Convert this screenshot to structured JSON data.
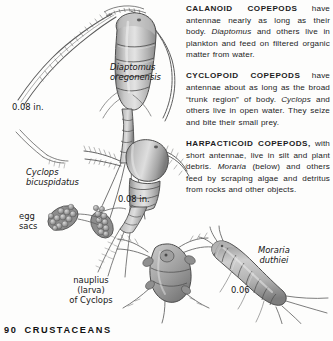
{
  "page": {
    "number": "90",
    "section_title": "CRUSTACEANS"
  },
  "text_column": {
    "paragraphs": [
      {
        "lead": "CALANOID COPEPODS",
        "body_before_italic": " have antennae nearly as long as their body. ",
        "italic": "Diaptomus",
        "body_after_italic": " and others live in plankton and feed on filtered organic matter from water."
      },
      {
        "lead": "CYCLOPOID COPEPODS",
        "body_before_italic": " have antennae about as long as the broad “trunk region” of body. ",
        "italic": "Cyclops",
        "body_after_italic": " and others live in open water. They seize and bite their small prey."
      },
      {
        "lead": "HARPACTICOID COPEPODS,",
        "body_before_italic": " with short antennae, live in silt and plant debris. ",
        "italic": "Moraria",
        "body_after_italic": " (below) and others feed by scraping algae and detritus from rocks and other objects."
      }
    ]
  },
  "illustration": {
    "labels": {
      "diaptomus": "Diaptomus\noregonensis",
      "cyclops": "Cyclops\nbicuspidatus",
      "egg_sacs": "egg\nsacs",
      "nauplius": "nauplius\n(larva)\nof Cyclops",
      "moraria": "Moraria\nduthiei"
    },
    "measurements": {
      "diaptomus_size": "0.08 in.",
      "cyclops_size": "0.08 in.",
      "moraria_size": "0.06"
    }
  },
  "colors": {
    "page_background": "#fdfdfc",
    "ink": "#1c1c1c",
    "art_shade_light": "#cfcfcf",
    "art_shade_mid": "#a8a8a8",
    "art_shade_dark": "#6e6e6e",
    "art_outline": "#3a3a3a"
  }
}
